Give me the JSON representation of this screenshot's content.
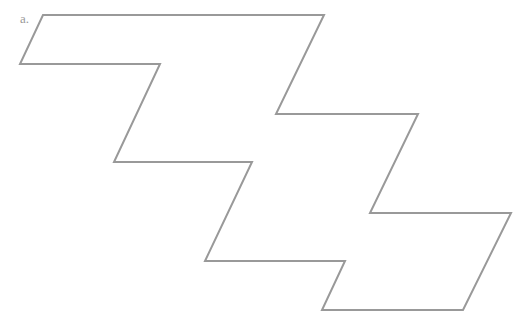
{
  "figure": {
    "label": "a.",
    "stroke_color": "#999999",
    "shape": "zigzag-polygon",
    "points": "43,15 324,15 276,114 418,114 370,213 511,213 463,310 322,310 345,261 205,261 252,162 114,162 160,64 20,64"
  }
}
